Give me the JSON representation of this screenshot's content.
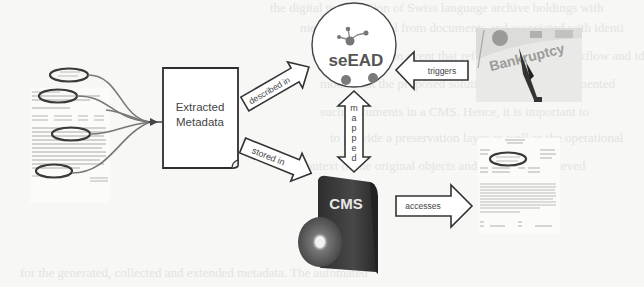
{
  "background_ghost_lines": [
    "the digital preservation of Swiss language archive holdings with",
    "metadata extracted from documents and associated with identi",
    "a preservation event that reflects a business workflow and id",
    "model that the proposed solution should be implemented",
    "such documents in a CMS. Hence, it is important to",
    "to provide a preservation layer as well as the operational",
    "context of the original objects and this can be achieved",
    "for the generated, collected and extended metadata. The automated"
  ],
  "diagram": {
    "source_document": {
      "label": "source-document-with-highlighted-fields",
      "highlight_count": 4
    },
    "extracted_metadata": {
      "line1": "Extracted",
      "line2": "Metadata"
    },
    "seead": {
      "label": "seEAD"
    },
    "cms": {
      "label": "CMS"
    },
    "bankruptcy_image": {
      "label": "Bankruptcy"
    },
    "output_document": {
      "label": "output-document-with-highlighted-field"
    },
    "arrows": {
      "described_in": "described in",
      "stored_in": "stored in",
      "triggers": "triggers",
      "mapped": [
        "m",
        "a",
        "p",
        "p",
        "e",
        "d"
      ],
      "accesses": "accesses"
    },
    "colors": {
      "stroke": "#333333",
      "ellipse": "#3a3a3a",
      "cms_box": "#3c3c3c",
      "node_dot": "#777777",
      "arrow_fill": "#ffffff"
    }
  }
}
